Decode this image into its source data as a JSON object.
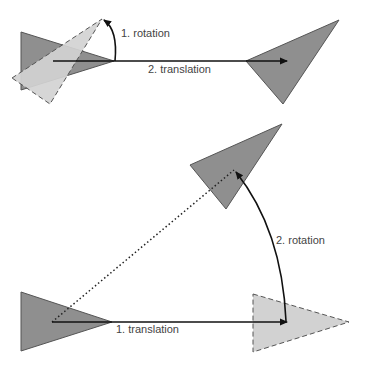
{
  "colors": {
    "dark_fill": "#8f8f8f",
    "light_fill": "#d2d2d2",
    "stroke": "#4a4a4a",
    "arrow": "#111111",
    "text": "#444444"
  },
  "top_diagram": {
    "rotation_label": "1. rotation",
    "translation_label": "2. translation"
  },
  "bottom_diagram": {
    "translation_label": "1. translation",
    "rotation_label": "2. rotation"
  }
}
